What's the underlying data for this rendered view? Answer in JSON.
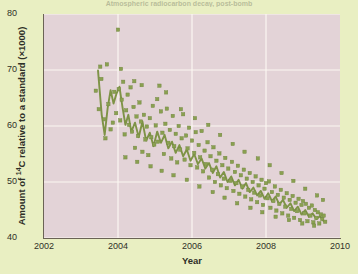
{
  "figure": {
    "title_cropped": "Atmospheric radiocarbon decay, post-bomb",
    "xlabel": "Year",
    "ylabel_prefix": "Amount of ",
    "ylabel_sup": "14",
    "ylabel_suffix": "C relative to a standard (×1000)"
  },
  "colors": {
    "page_background": "#e9efc2",
    "panel_background": "#e3d3d7",
    "gridline": "#fbf7f2",
    "marker": "#8aa050",
    "marker_edge": "#6f8440",
    "trendline": "#7e9346",
    "axis": "#6b6355",
    "text": "#2f2f28"
  },
  "chart_data": {
    "type": "scatter",
    "title": "Atmospheric radiocarbon decay, post-bomb",
    "xlabel": "Year",
    "ylabel": "Amount of 14C relative to a standard (×1000)",
    "xlim": [
      2002,
      2010
    ],
    "ylim": [
      40,
      80
    ],
    "xticks": [
      2002,
      2004,
      2006,
      2008,
      2010
    ],
    "yticks": [
      40,
      50,
      60,
      70,
      80
    ],
    "grid": true,
    "legend": null,
    "series": [
      {
        "name": "14C measurements",
        "marker": "square",
        "color": "#8aa050",
        "points": [
          [
            2003.4,
            66.3
          ],
          [
            2003.48,
            63.0
          ],
          [
            2003.55,
            68.4
          ],
          [
            2003.62,
            61.2
          ],
          [
            2003.7,
            71.0
          ],
          [
            2003.74,
            63.9
          ],
          [
            2003.8,
            59.4
          ],
          [
            2003.86,
            60.6
          ],
          [
            2003.9,
            66.1
          ],
          [
            2003.95,
            62.3
          ],
          [
            2004.0,
            77.2
          ],
          [
            2004.02,
            66.6
          ],
          [
            2004.06,
            61.0
          ],
          [
            2004.1,
            64.7
          ],
          [
            2004.14,
            67.9
          ],
          [
            2004.18,
            58.5
          ],
          [
            2004.22,
            62.8
          ],
          [
            2004.26,
            65.6
          ],
          [
            2004.3,
            60.2
          ],
          [
            2004.34,
            66.9
          ],
          [
            2004.38,
            59.0
          ],
          [
            2004.42,
            63.4
          ],
          [
            2004.46,
            56.1
          ],
          [
            2004.5,
            61.7
          ],
          [
            2004.54,
            58.2
          ],
          [
            2004.58,
            64.2
          ],
          [
            2004.62,
            60.8
          ],
          [
            2004.66,
            55.4
          ],
          [
            2004.7,
            62.0
          ],
          [
            2004.74,
            57.6
          ],
          [
            2004.78,
            59.9
          ],
          [
            2004.82,
            54.8
          ],
          [
            2004.86,
            61.4
          ],
          [
            2004.9,
            58.0
          ],
          [
            2004.94,
            63.6
          ],
          [
            2004.98,
            56.7
          ],
          [
            2005.02,
            60.1
          ],
          [
            2005.08,
            57.2
          ],
          [
            2005.12,
            67.2
          ],
          [
            2005.16,
            62.6
          ],
          [
            2005.2,
            58.8
          ],
          [
            2005.24,
            55.0
          ],
          [
            2005.28,
            60.4
          ],
          [
            2005.32,
            63.1
          ],
          [
            2005.36,
            57.0
          ],
          [
            2005.4,
            59.3
          ],
          [
            2005.44,
            54.2
          ],
          [
            2005.48,
            61.8
          ],
          [
            2005.52,
            56.4
          ],
          [
            2005.56,
            58.6
          ],
          [
            2005.6,
            53.5
          ],
          [
            2005.64,
            60.0
          ],
          [
            2005.68,
            55.8
          ],
          [
            2005.72,
            57.8
          ],
          [
            2005.76,
            62.1
          ],
          [
            2005.8,
            54.0
          ],
          [
            2005.84,
            58.3
          ],
          [
            2005.88,
            56.0
          ],
          [
            2005.92,
            59.7
          ],
          [
            2005.96,
            53.0
          ],
          [
            2006.0,
            57.4
          ],
          [
            2006.06,
            55.2
          ],
          [
            2006.1,
            58.9
          ],
          [
            2006.14,
            52.6
          ],
          [
            2006.18,
            56.6
          ],
          [
            2006.22,
            54.4
          ],
          [
            2006.26,
            59.1
          ],
          [
            2006.3,
            51.9
          ],
          [
            2006.34,
            55.6
          ],
          [
            2006.38,
            53.2
          ],
          [
            2006.42,
            57.1
          ],
          [
            2006.46,
            50.8
          ],
          [
            2006.5,
            54.6
          ],
          [
            2006.54,
            52.2
          ],
          [
            2006.58,
            56.2
          ],
          [
            2006.62,
            50.0
          ],
          [
            2006.66,
            53.8
          ],
          [
            2006.7,
            51.4
          ],
          [
            2006.74,
            55.1
          ],
          [
            2006.78,
            49.4
          ],
          [
            2006.82,
            53.0
          ],
          [
            2006.86,
            50.6
          ],
          [
            2006.9,
            54.3
          ],
          [
            2006.94,
            48.9
          ],
          [
            2006.98,
            52.4
          ],
          [
            2007.04,
            50.2
          ],
          [
            2007.08,
            53.6
          ],
          [
            2007.12,
            48.4
          ],
          [
            2007.16,
            51.8
          ],
          [
            2007.2,
            49.8
          ],
          [
            2007.24,
            52.9
          ],
          [
            2007.28,
            47.9
          ],
          [
            2007.32,
            51.2
          ],
          [
            2007.36,
            49.2
          ],
          [
            2007.4,
            52.2
          ],
          [
            2007.44,
            47.4
          ],
          [
            2007.48,
            50.6
          ],
          [
            2007.52,
            48.6
          ],
          [
            2007.56,
            51.6
          ],
          [
            2007.6,
            46.9
          ],
          [
            2007.64,
            50.0
          ],
          [
            2007.68,
            48.1
          ],
          [
            2007.72,
            51.0
          ],
          [
            2007.76,
            46.4
          ],
          [
            2007.8,
            49.4
          ],
          [
            2007.84,
            47.6
          ],
          [
            2007.88,
            50.4
          ],
          [
            2007.92,
            45.9
          ],
          [
            2007.96,
            48.8
          ],
          [
            2008.0,
            49.8
          ],
          [
            2008.04,
            47.1
          ],
          [
            2008.08,
            50.1
          ],
          [
            2008.12,
            45.4
          ],
          [
            2008.16,
            48.2
          ],
          [
            2008.2,
            46.6
          ],
          [
            2008.24,
            49.2
          ],
          [
            2008.28,
            44.9
          ],
          [
            2008.32,
            47.7
          ],
          [
            2008.36,
            46.1
          ],
          [
            2008.4,
            48.6
          ],
          [
            2008.44,
            44.4
          ],
          [
            2008.48,
            47.2
          ],
          [
            2008.52,
            45.6
          ],
          [
            2008.56,
            48.0
          ],
          [
            2008.6,
            44.0
          ],
          [
            2008.64,
            46.8
          ],
          [
            2008.68,
            45.2
          ],
          [
            2008.72,
            47.5
          ],
          [
            2008.76,
            43.6
          ],
          [
            2008.8,
            46.3
          ],
          [
            2008.84,
            44.8
          ],
          [
            2008.88,
            47.0
          ],
          [
            2008.92,
            43.2
          ],
          [
            2008.96,
            45.9
          ],
          [
            2009.0,
            46.6
          ],
          [
            2009.04,
            44.4
          ],
          [
            2009.08,
            46.1
          ],
          [
            2009.12,
            43.0
          ],
          [
            2009.16,
            45.4
          ],
          [
            2009.2,
            44.0
          ],
          [
            2009.24,
            45.8
          ],
          [
            2009.28,
            42.8
          ],
          [
            2009.32,
            45.0
          ],
          [
            2009.36,
            43.6
          ],
          [
            2009.4,
            44.6
          ],
          [
            2009.44,
            42.6
          ],
          [
            2009.48,
            44.2
          ],
          [
            2009.52,
            43.4
          ],
          [
            2009.56,
            44.0
          ],
          [
            2009.6,
            42.9
          ],
          [
            2003.52,
            70.6
          ],
          [
            2003.66,
            57.8
          ],
          [
            2004.08,
            70.2
          ],
          [
            2004.44,
            68.0
          ],
          [
            2004.64,
            67.3
          ],
          [
            2005.06,
            64.8
          ],
          [
            2005.3,
            66.0
          ],
          [
            2005.7,
            63.0
          ],
          [
            2006.08,
            61.4
          ],
          [
            2006.44,
            60.2
          ],
          [
            2006.76,
            58.4
          ],
          [
            2007.1,
            56.8
          ],
          [
            2007.42,
            55.4
          ],
          [
            2007.78,
            54.2
          ],
          [
            2008.1,
            53.0
          ],
          [
            2008.42,
            51.6
          ],
          [
            2008.74,
            50.2
          ],
          [
            2009.06,
            48.8
          ],
          [
            2009.38,
            47.6
          ],
          [
            2009.54,
            46.8
          ],
          [
            2004.2,
            54.4
          ],
          [
            2004.52,
            53.6
          ],
          [
            2004.88,
            52.8
          ],
          [
            2005.18,
            52.0
          ],
          [
            2005.5,
            51.2
          ],
          [
            2005.86,
            50.4
          ],
          [
            2006.2,
            49.2
          ],
          [
            2006.56,
            48.2
          ],
          [
            2006.88,
            47.2
          ],
          [
            2007.22,
            46.2
          ],
          [
            2007.58,
            45.4
          ],
          [
            2007.9,
            44.6
          ],
          [
            2008.26,
            43.8
          ],
          [
            2008.62,
            43.2
          ],
          [
            2008.98,
            42.6
          ],
          [
            2009.3,
            42.2
          ]
        ]
      }
    ],
    "trendline": {
      "name": "connecting line",
      "color": "#7e9346",
      "points": [
        [
          2003.46,
          69.9
        ],
        [
          2003.56,
          62.0
        ],
        [
          2003.64,
          58.4
        ],
        [
          2003.72,
          63.2
        ],
        [
          2003.8,
          66.4
        ],
        [
          2003.88,
          64.0
        ],
        [
          2003.96,
          65.8
        ],
        [
          2004.04,
          67.0
        ],
        [
          2004.12,
          63.4
        ],
        [
          2004.2,
          60.2
        ],
        [
          2004.28,
          62.0
        ],
        [
          2004.36,
          59.0
        ],
        [
          2004.46,
          60.6
        ],
        [
          2004.56,
          58.0
        ],
        [
          2004.66,
          60.8
        ],
        [
          2004.76,
          57.4
        ],
        [
          2004.86,
          58.8
        ],
        [
          2004.96,
          56.4
        ],
        [
          2005.06,
          59.0
        ],
        [
          2005.16,
          57.0
        ],
        [
          2005.26,
          58.4
        ],
        [
          2005.36,
          56.0
        ],
        [
          2005.46,
          57.2
        ],
        [
          2005.56,
          55.2
        ],
        [
          2005.66,
          56.6
        ],
        [
          2005.76,
          54.6
        ],
        [
          2005.86,
          55.8
        ],
        [
          2005.96,
          53.8
        ],
        [
          2006.06,
          55.0
        ],
        [
          2006.16,
          53.2
        ],
        [
          2006.26,
          54.2
        ],
        [
          2006.36,
          52.4
        ],
        [
          2006.46,
          53.4
        ],
        [
          2006.56,
          51.6
        ],
        [
          2006.66,
          52.8
        ],
        [
          2006.76,
          50.8
        ],
        [
          2006.86,
          51.8
        ],
        [
          2006.96,
          50.0
        ],
        [
          2007.06,
          51.0
        ],
        [
          2007.16,
          49.4
        ],
        [
          2007.26,
          50.4
        ],
        [
          2007.36,
          48.8
        ],
        [
          2007.46,
          49.8
        ],
        [
          2007.56,
          48.2
        ],
        [
          2007.66,
          49.0
        ],
        [
          2007.76,
          47.6
        ],
        [
          2007.86,
          48.4
        ],
        [
          2007.96,
          47.0
        ],
        [
          2008.06,
          48.0
        ],
        [
          2008.16,
          46.6
        ],
        [
          2008.26,
          47.4
        ],
        [
          2008.36,
          46.0
        ],
        [
          2008.46,
          46.8
        ],
        [
          2008.56,
          45.4
        ],
        [
          2008.66,
          46.2
        ],
        [
          2008.76,
          44.8
        ],
        [
          2008.86,
          45.6
        ],
        [
          2008.96,
          44.2
        ],
        [
          2009.06,
          45.0
        ],
        [
          2009.16,
          43.8
        ],
        [
          2009.26,
          44.4
        ],
        [
          2009.36,
          43.4
        ],
        [
          2009.46,
          43.9
        ],
        [
          2009.56,
          43.0
        ]
      ]
    }
  }
}
